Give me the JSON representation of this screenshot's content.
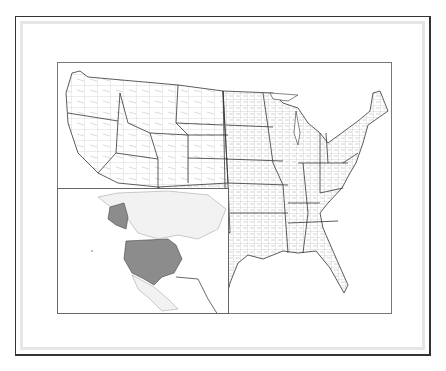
{
  "figure": {
    "style": "grayscale line map with county and state outlines",
    "colors": {
      "background": "#ffffff",
      "frame": "#333333",
      "frame_inner": "#e6e6e6",
      "county_lines": "#9a9a9a",
      "state_lines": "#333333",
      "inset_highlight": "#8c8c8c",
      "inset_land": "#f2f2f2"
    }
  },
  "main_map": {
    "region": "Contiguous United States",
    "layers": [
      "county boundaries",
      "state boundaries"
    ]
  },
  "inset_map": {
    "position": "lower-left",
    "region": "North America locator",
    "highlighted": [
      "Contiguous United States",
      "Alaska"
    ]
  }
}
